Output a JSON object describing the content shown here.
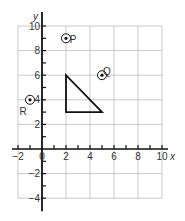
{
  "diagram": {
    "type": "coordinate-grid",
    "origin_px": [
      42,
      149
    ],
    "unit_px_x": 12,
    "unit_px_y": 12.3,
    "x_range": [
      -2,
      10
    ],
    "y_range": [
      -4,
      10
    ],
    "grid_step": 2,
    "x_axis_label": "x",
    "y_axis_label": "y",
    "x_tick_labels": [
      {
        "value": -2,
        "text": "−2"
      },
      {
        "value": 0,
        "text": "0"
      },
      {
        "value": 2,
        "text": "2"
      },
      {
        "value": 4,
        "text": "4"
      },
      {
        "value": 6,
        "text": "6"
      },
      {
        "value": 8,
        "text": "8"
      },
      {
        "value": 10,
        "text": "10"
      }
    ],
    "y_tick_labels": [
      {
        "value": 10,
        "text": "10"
      },
      {
        "value": 8,
        "text": "8"
      },
      {
        "value": 6,
        "text": "6"
      },
      {
        "value": 4,
        "text": "4"
      },
      {
        "value": 2,
        "text": "2"
      },
      {
        "value": -2,
        "text": "−2"
      },
      {
        "value": -4,
        "text": "−4"
      }
    ],
    "points": [
      {
        "name": "P",
        "x": 2,
        "y": 9,
        "label_offset": [
          7,
          1
        ]
      },
      {
        "name": "Q",
        "x": 5,
        "y": 6,
        "label_offset": [
          5,
          -4
        ]
      },
      {
        "name": "R",
        "x": -1,
        "y": 4,
        "label_offset": [
          -7,
          12
        ]
      }
    ],
    "triangle": {
      "vertices": [
        [
          2,
          6
        ],
        [
          2,
          3
        ],
        [
          5,
          3
        ]
      ]
    },
    "colors": {
      "grid": "#bdbdbd",
      "axis": "#111111",
      "shape": "#111111",
      "text": "#333333"
    }
  }
}
